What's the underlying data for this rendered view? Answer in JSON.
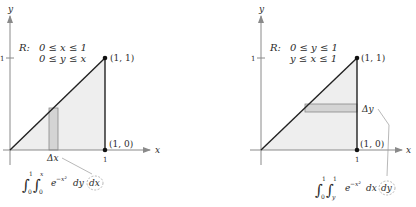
{
  "left_panel": {
    "axis_x_label": "x",
    "axis_y_label": "y",
    "tick_x": "1",
    "tick_y": "1",
    "region_label": "R:",
    "region_line1": "0 ≤ x ≤ 1",
    "region_line2": "0 ≤ y ≤ x",
    "point_top": "(1, 1)",
    "point_bottom": "(1, 0)",
    "strip_label": "Δx",
    "integral": {
      "lower_outer": "0",
      "upper_outer": "1",
      "lower_inner": "0",
      "upper_inner": "x",
      "integrand": "e",
      "exponent": "−x²",
      "inner_diff": "dy",
      "outer_diff": "dx"
    }
  },
  "right_panel": {
    "axis_x_label": "x",
    "axis_y_label": "y",
    "tick_x": "1",
    "tick_y": "1",
    "region_label": "R:",
    "region_line1": "0 ≤ y ≤ 1",
    "region_line2": "y ≤ x ≤ 1",
    "point_top": "(1, 1)",
    "point_bottom": "(1, 0)",
    "strip_label": "Δy",
    "integral": {
      "lower_outer": "0",
      "upper_outer": "1",
      "lower_inner": "y",
      "upper_inner": "1",
      "integrand": "e",
      "exponent": "−x²",
      "inner_diff": "dx",
      "outer_diff": "dy"
    }
  },
  "colors": {
    "region_fill": "#eeeeee",
    "strip_fill": "#d4d4d4",
    "line": "#222222",
    "axis": "#8a8a8a"
  }
}
